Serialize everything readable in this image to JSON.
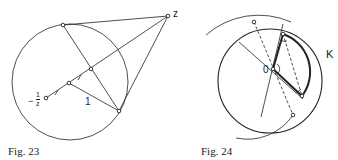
{
  "figures": [
    {
      "id": "fig23",
      "caption": "Fig. 23",
      "labels": {
        "z": "z",
        "neg_inv_z_minus": "−",
        "neg_inv_z_num": "1",
        "neg_inv_z_den": "z",
        "one": "1"
      }
    },
    {
      "id": "fig24",
      "caption": "Fig. 24",
      "labels": {
        "origin": "0",
        "circle": "K"
      }
    }
  ],
  "colors": {
    "ink": "#222222",
    "background": "#ffffff"
  }
}
